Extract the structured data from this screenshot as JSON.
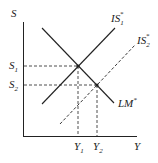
{
  "diagram": {
    "type": "economics-graph",
    "axes": {
      "y_label": "S",
      "x_label": "Y"
    },
    "curves": [
      {
        "name": "LM*",
        "label": "LM",
        "label_sup": "*",
        "style": "solid",
        "slope": "downward"
      },
      {
        "name": "IS1*",
        "label": "IS",
        "label_sub": "1",
        "label_sup": "*",
        "style": "solid",
        "slope": "upward"
      },
      {
        "name": "IS2*",
        "label": "IS",
        "label_sub": "2",
        "label_sup": "*",
        "style": "dashed",
        "slope": "upward"
      }
    ],
    "y_ticks": [
      {
        "label": "S",
        "sub": "1"
      },
      {
        "label": "S",
        "sub": "2"
      }
    ],
    "x_ticks": [
      {
        "label": "Y",
        "sub": "1"
      },
      {
        "label": "Y",
        "sub": "2"
      }
    ],
    "equilibria": [
      {
        "name": "E1",
        "x": "Y1",
        "y": "S1"
      },
      {
        "name": "E2",
        "x": "Y2",
        "y": "S2"
      }
    ],
    "colors": {
      "ink": "#222222",
      "background": "#ffffff"
    }
  }
}
